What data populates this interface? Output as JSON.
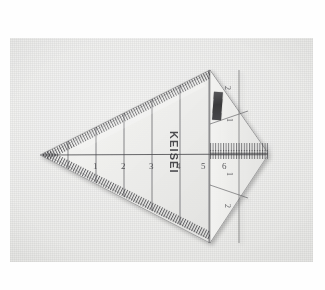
{
  "photo": {
    "subject": "keisei-triangular-scale-ruler",
    "background_color": "#e8e8e6",
    "frame_color": "#fefefe"
  },
  "ruler": {
    "brand": "KEISEI",
    "body_fill": "#f3f3f1",
    "line_color": "#3c3c40",
    "sticker_color": "#2f2f31",
    "horizontal_scale": {
      "labels": [
        "1",
        "2",
        "3",
        "4",
        "5",
        "6"
      ],
      "label_x": [
        83,
        111,
        139,
        166,
        191,
        212
      ],
      "label_y": 128
    },
    "vertical_scale_upper": {
      "labels": [
        "2",
        "1"
      ],
      "label_x": [
        230,
        231
      ],
      "label_y": [
        48,
        80
      ]
    },
    "vertical_scale_lower": {
      "labels": [
        "1",
        "2"
      ],
      "label_x": [
        231,
        230
      ],
      "label_y": [
        132,
        168
      ]
    }
  }
}
